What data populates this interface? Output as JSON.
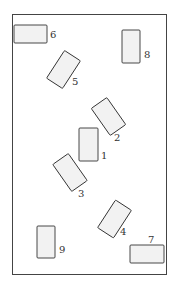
{
  "diagram": {
    "frame": {
      "x": 12,
      "y": 14,
      "w": 154,
      "h": 260
    },
    "rect_fill": "#f2f2f2",
    "stroke": "#333333",
    "rects": [
      {
        "id": "1",
        "label": "1",
        "cx": 88.5,
        "cy": 144.5,
        "w": 19,
        "h": 33,
        "angle": 0,
        "lx": 101,
        "ly": 159
      },
      {
        "id": "2",
        "label": "2",
        "cx": 108.5,
        "cy": 116.5,
        "w": 19,
        "h": 33,
        "angle": -35,
        "lx": 114,
        "ly": 141
      },
      {
        "id": "3",
        "label": "3",
        "cx": 70,
        "cy": 172.5,
        "w": 19,
        "h": 33,
        "angle": -35,
        "lx": 78,
        "ly": 197
      },
      {
        "id": "4",
        "label": "4",
        "cx": 114.5,
        "cy": 219,
        "w": 19,
        "h": 33,
        "angle": 33,
        "lx": 120,
        "ly": 235
      },
      {
        "id": "5",
        "label": "5",
        "cx": 63.5,
        "cy": 69.5,
        "w": 19,
        "h": 33,
        "angle": 33,
        "lx": 72,
        "ly": 85
      },
      {
        "id": "6",
        "label": "6",
        "cx": 30.5,
        "cy": 34,
        "w": 33,
        "h": 18,
        "angle": 0,
        "lx": 50,
        "ly": 38
      },
      {
        "id": "7",
        "label": "7",
        "cx": 147,
        "cy": 254,
        "w": 34,
        "h": 18,
        "angle": 0,
        "lx": 148,
        "ly": 243
      },
      {
        "id": "8",
        "label": "8",
        "cx": 131,
        "cy": 46.5,
        "w": 18,
        "h": 33,
        "angle": 0,
        "lx": 144,
        "ly": 58
      },
      {
        "id": "9",
        "label": "9",
        "cx": 46,
        "cy": 242,
        "w": 18,
        "h": 32,
        "angle": 0,
        "lx": 59,
        "ly": 253
      }
    ]
  }
}
